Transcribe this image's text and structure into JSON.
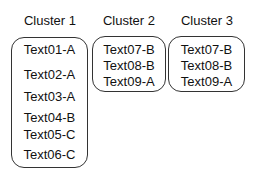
{
  "clusters": [
    {
      "title": "Cluster 1",
      "items": [
        "Text01-A",
        "Text02-A",
        "Text03-A",
        "Text04-B",
        "Text05-C",
        "Text06-C"
      ]
    },
    {
      "title": "Cluster 2",
      "items": [
        "Text07-B",
        "Text08-B",
        "Text09-A"
      ]
    },
    {
      "title": "Cluster 3",
      "items": [
        "Text07-B",
        "Text08-B",
        "Text09-A"
      ]
    }
  ]
}
